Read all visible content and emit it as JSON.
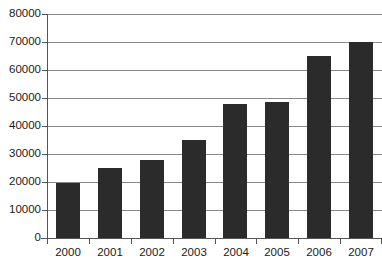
{
  "chart_data": {
    "type": "bar",
    "title": "",
    "title_note": "chart title is cropped off the top edge of the screenshot",
    "xlabel": "",
    "ylabel": "",
    "categories": [
      "2000",
      "2001",
      "2002",
      "2003",
      "2004",
      "2005",
      "2006",
      "2007"
    ],
    "values": [
      19800,
      25000,
      28000,
      35000,
      48000,
      48600,
      65000,
      70000
    ],
    "ylim": [
      0,
      80000
    ],
    "ytick_labels": [
      "80000",
      "70000",
      "60000",
      "50000",
      "40000",
      "30000",
      "20000",
      "10000",
      "0"
    ],
    "ytick_values": [
      80000,
      70000,
      60000,
      50000,
      40000,
      30000,
      20000,
      10000,
      0
    ],
    "grid": true,
    "legend": false,
    "legend_position": "none",
    "series": [
      {
        "name": "",
        "values": [
          19800,
          25000,
          28000,
          35000,
          48000,
          48600,
          65000,
          70000
        ]
      }
    ]
  },
  "style": {
    "bar_color": "#2b2b2b",
    "gridline_color": "#8a8a8a",
    "axis_color": "#555555",
    "background_color": "#ffffff",
    "text_color": "#1a1a1a"
  },
  "cropped_title_text": ""
}
